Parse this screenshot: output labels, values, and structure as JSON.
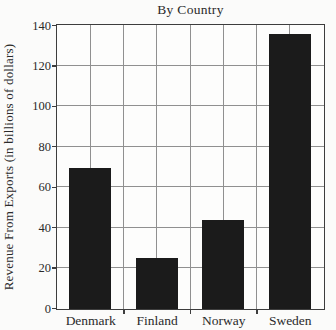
{
  "chart_data": {
    "type": "bar",
    "title": "By Country",
    "xlabel": "",
    "ylabel": "Revenue From Exports (in billions of dollars)",
    "categories": [
      "Denmark",
      "Finland",
      "Norway",
      "Sweden"
    ],
    "values": [
      70,
      25,
      44,
      136
    ],
    "ylim": [
      0,
      140
    ],
    "ytick_step": 20,
    "ytick_labels": [
      "0",
      "20",
      "40",
      "60",
      "80",
      "100",
      "120",
      "140"
    ],
    "grid": true,
    "legend": "none",
    "colors": {
      "bar": "#1b1b1b",
      "grid": "#909090",
      "frame": "#3d3d3d",
      "background": "#fbfbfa",
      "text": "#2a2a2a"
    }
  }
}
